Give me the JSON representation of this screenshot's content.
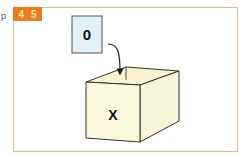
{
  "side_marker": "p",
  "badge": {
    "items": [
      "4",
      "5"
    ],
    "color": "#f07a1e",
    "text_color": "#ffe9a8"
  },
  "frame": {
    "border_color": "#f2b98a"
  },
  "value_card": {
    "label": "0",
    "fill": "#e2f1f8",
    "stroke": "#555555"
  },
  "arrow": {
    "from": "value_card",
    "to": "variable_box",
    "icon": "arrow-down-curved-icon"
  },
  "variable_box": {
    "label": "X",
    "fill": "#fbf9dc",
    "stroke": "#333333"
  }
}
